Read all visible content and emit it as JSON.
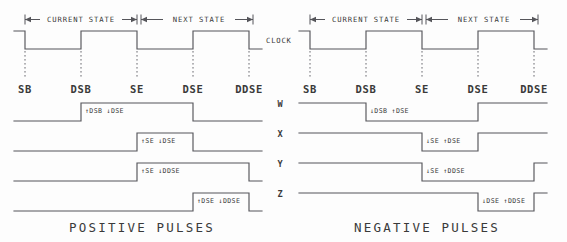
{
  "figure": {
    "background_color": "#fdfdfd",
    "line_color": "#55555a",
    "text_color": "#3a3a3a",
    "clock_label": "CLOCK"
  },
  "dimensions": {
    "current_state": "CURRENT STATE",
    "next_state": "NEXT STATE"
  },
  "time_markers": [
    {
      "id": "sb",
      "label": "SB"
    },
    {
      "id": "dsb",
      "label": "DSB"
    },
    {
      "id": "se",
      "label": "SE"
    },
    {
      "id": "dse",
      "label": "DSE"
    },
    {
      "id": "ddse",
      "label": "DDSE"
    }
  ],
  "panels": [
    {
      "id": "positive",
      "caption": "POSITIVE PULSES",
      "clock": {
        "name": "clock-waveform",
        "start_level": "high",
        "transitions": [
          {
            "at": "sb",
            "edge": "falling"
          },
          {
            "at": "dsb",
            "edge": "rising"
          },
          {
            "at": "se",
            "edge": "falling"
          },
          {
            "at": "dse",
            "edge": "rising"
          },
          {
            "at": "ddse",
            "edge": "falling"
          }
        ]
      },
      "rows": [
        {
          "id": "w",
          "label": "W",
          "annotation": "↑DSB ↓DSE",
          "rise_at": "dsb",
          "fall_at": "dse",
          "polarity": "positive"
        },
        {
          "id": "x",
          "label": "X",
          "annotation": "↑SE ↓DSE",
          "rise_at": "se",
          "fall_at": "dse",
          "polarity": "positive"
        },
        {
          "id": "y",
          "label": "Y",
          "annotation": "↑SE ↓DDSE",
          "rise_at": "se",
          "fall_at": "ddse",
          "polarity": "positive"
        },
        {
          "id": "z",
          "label": "Z",
          "annotation": "↑DSE ↓DDSE",
          "rise_at": "dse",
          "fall_at": "ddse",
          "polarity": "positive"
        }
      ]
    },
    {
      "id": "negative",
      "caption": "NEGATIVE PULSES",
      "clock": {
        "name": "clock-waveform",
        "start_level": "high",
        "transitions": [
          {
            "at": "sb",
            "edge": "falling"
          },
          {
            "at": "dsb",
            "edge": "rising"
          },
          {
            "at": "se",
            "edge": "falling"
          },
          {
            "at": "dse",
            "edge": "rising"
          },
          {
            "at": "ddse",
            "edge": "falling"
          }
        ]
      },
      "rows": [
        {
          "id": "w",
          "label": "W",
          "annotation": "↓DSB ↑DSE",
          "fall_at": "dsb",
          "rise_at": "dse",
          "polarity": "negative"
        },
        {
          "id": "x",
          "label": "X",
          "annotation": "↓SE ↑DSE",
          "fall_at": "se",
          "rise_at": "dse",
          "polarity": "negative"
        },
        {
          "id": "y",
          "label": "Y",
          "annotation": "↓SE ↑DDSE",
          "fall_at": "se",
          "rise_at": "ddse",
          "polarity": "negative"
        },
        {
          "id": "z",
          "label": "Z",
          "annotation": "↓DSE ↑DDSE",
          "fall_at": "dse",
          "rise_at": "ddse",
          "polarity": "negative"
        }
      ]
    }
  ]
}
